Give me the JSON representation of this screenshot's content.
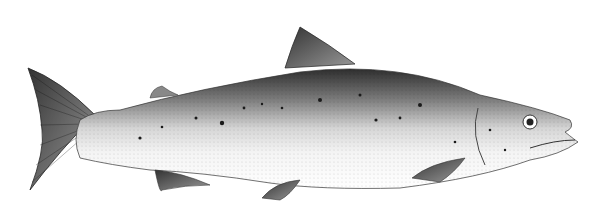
{
  "image": {
    "subject": "salmon illustration",
    "style": "monochrome engraving",
    "colors": {
      "background": "#ffffff",
      "dark": "#2a2a2a",
      "mid": "#8a8a8a",
      "light": "#e8e8e8"
    }
  }
}
